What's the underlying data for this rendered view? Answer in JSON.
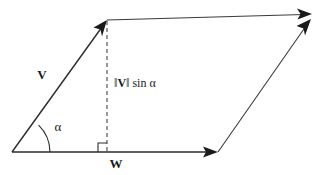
{
  "figure": {
    "background_color": "#ffffff",
    "ink_color": "#1a1a1a",
    "width": 329,
    "height": 175
  },
  "labels": {
    "vector_v": "V",
    "vector_w": "W",
    "angle": "α",
    "height_norm_open": "‖",
    "height_norm_vector": "V",
    "height_norm_close": "‖",
    "height_function": "sin",
    "height_angle": "α"
  },
  "geometry": {
    "origin": {
      "x": 12,
      "y": 152
    },
    "v_tip": {
      "x": 107,
      "y": 20
    },
    "w_tip": {
      "x": 218,
      "y": 152
    },
    "far_corner": {
      "x": 312,
      "y": 17
    },
    "foot_of_height": {
      "x": 107,
      "y": 152
    },
    "angle_arc_radius": 38,
    "right_angle_size": 9
  },
  "elements": {
    "vector_v_name": "vector-v",
    "vector_w_name": "vector-w",
    "height_line_name": "height-dashed-line",
    "angle_arc_name": "angle-arc",
    "right_angle_name": "right-angle-marker",
    "top_edge_name": "parallelogram-top-edge",
    "right_edge_name": "parallelogram-right-edge"
  }
}
